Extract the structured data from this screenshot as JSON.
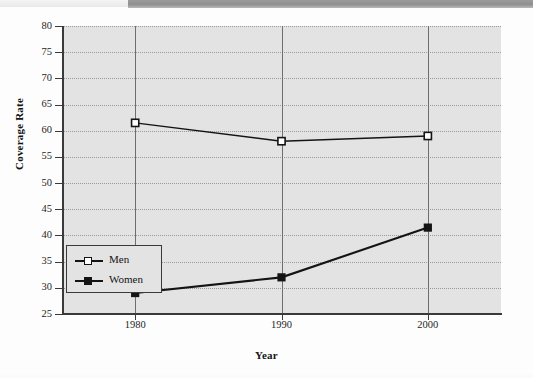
{
  "chart_data": {
    "type": "line",
    "title": "",
    "xlabel": "Year",
    "ylabel": "Coverage Rate",
    "categories": [
      "1980",
      "1990",
      "2000"
    ],
    "x": [
      1980,
      1990,
      2000
    ],
    "xlim": [
      1975,
      2005
    ],
    "ylim": [
      25,
      80
    ],
    "ytick_labels": [
      "80",
      "75",
      "70",
      "65",
      "60",
      "55",
      "50",
      "45",
      "40",
      "35",
      "30",
      "25"
    ],
    "yticks": [
      80,
      75,
      70,
      65,
      60,
      55,
      50,
      45,
      40,
      35,
      30,
      25
    ],
    "grid": "horizontal-dotted-and-vertical-solid",
    "legend_position": "lower-left-inside",
    "series": [
      {
        "name": "Men",
        "marker": "open-square",
        "values": [
          61.5,
          58.0,
          59.0
        ]
      },
      {
        "name": "Women",
        "marker": "filled-square",
        "values": [
          29.0,
          32.0,
          41.5
        ]
      }
    ],
    "colors": {
      "line": "#141414",
      "plot_background": "#e3e3e3",
      "axis": "#3a3a3a",
      "gridline_horizontal": "#9a9a9a",
      "gridline_vertical": "#6e6e6e"
    }
  },
  "legend": {
    "items": [
      {
        "label": "Men"
      },
      {
        "label": "Women"
      }
    ]
  },
  "axes": {
    "x_title": "Year",
    "y_title": "Coverage Rate"
  }
}
